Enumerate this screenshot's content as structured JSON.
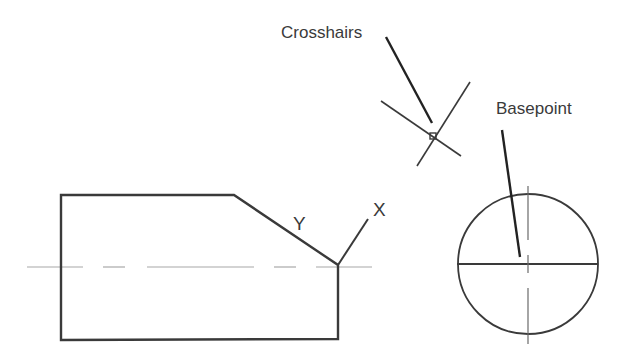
{
  "labels": {
    "crosshairs": "Crosshairs",
    "basepoint": "Basepoint",
    "axis_x": "X",
    "axis_y": "Y"
  },
  "colors": {
    "stroke": "#3a3a3a",
    "centerline": "#9a9a9a",
    "background": "#ffffff"
  }
}
